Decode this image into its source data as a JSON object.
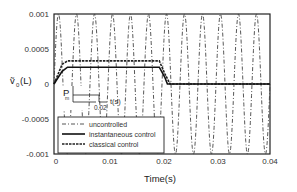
{
  "chart_data": {
    "type": "line",
    "title": "",
    "xlabel": "Time(s)",
    "ylabel": "ṽ₀(L)",
    "xlim": [
      0,
      0.04
    ],
    "ylim": [
      -0.001,
      0.001
    ],
    "x_ticks": [
      "0",
      "0.01",
      "0.02",
      "0.03",
      "0.04"
    ],
    "y_ticks": [
      "0.001",
      "0.0005",
      "0",
      "-0.0005",
      "-0.001"
    ],
    "grid": false,
    "legend_position": "lower-left",
    "series": [
      {
        "name": "uncontrolled",
        "style": "dash-dot",
        "description": "sinusoidal oscillation of amplitude ~0.001 (full axis range), ~12 cycles over 0.04 s",
        "amplitude": 0.001,
        "approx_cycles": 12
      },
      {
        "name": "instantaneous control",
        "style": "solid",
        "x": [
          0,
          0.0015,
          0.0025,
          0.0195,
          0.0205,
          0.021,
          0.04
        ],
        "values": [
          0,
          0.00018,
          0.00024,
          0.00024,
          0.0001,
          0,
          0
        ]
      },
      {
        "name": "classical control",
        "style": "dashed-thick",
        "x": [
          0,
          0.0015,
          0.0025,
          0.0195,
          0.0205,
          0.0215,
          0.04
        ],
        "values": [
          0,
          0.00028,
          0.00033,
          0.00033,
          0.00015,
          0,
          0
        ]
      }
    ],
    "inset": {
      "label": "P",
      "subscript": "m",
      "x_tick": "0.02",
      "x_axis_label": "t(s)",
      "shape": "rectangular pulse from 0 to 0.02 s"
    }
  },
  "labels": {
    "xlabel": "Time(s)",
    "ylabel_main": "ṽ",
    "ylabel_sub": "0",
    "ylabel_tail": "(L)",
    "inset_p": "P",
    "inset_m": "m",
    "inset_tick": "0.02",
    "inset_t": "t(s)",
    "y_ticks": [
      "0.001",
      "0.0005",
      "0",
      "-0.0005",
      "-0.001"
    ],
    "x_ticks": [
      "0",
      "0.01",
      "0.02",
      "0.03",
      "0.04"
    ],
    "legend": [
      "uncontrolled",
      "instantaneous control",
      "classical control"
    ]
  }
}
